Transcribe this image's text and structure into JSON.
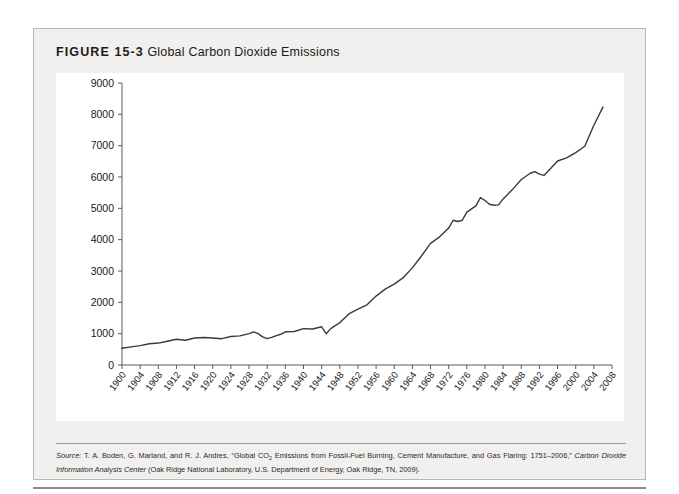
{
  "figure": {
    "label": "FIGURE 15-3",
    "name": "Global Carbon Dioxide Emissions"
  },
  "source": {
    "prefix": "Source:",
    "line": " T. A. Boden, G. Marland, and R. J. Andres, “Global CO2 Emissions from Fossil-Fuel Burning, Cement Manufacture, and Gas Flaring: 1751–2006,” ",
    "italic_work": "Carbon Dioxide Information Analysis Center",
    "tail": " (Oak Ridge National Laboratory, U.S. Department of Energy, Oak Ridge, TN, 2009)."
  },
  "colors": {
    "card_background": "#f1f0ee",
    "plot_background": "#ffffff",
    "line": "#3a3a3a",
    "axis": "#5a5a5a",
    "border": "#b9b7b4",
    "text": "#1a1a1a"
  },
  "chart_data": {
    "type": "line",
    "title": "Global Carbon Dioxide Emissions",
    "xlabel": "",
    "ylabel": "",
    "xlim": [
      1900,
      2008
    ],
    "ylim": [
      0,
      9000
    ],
    "ytick_values": [
      0,
      1000,
      2000,
      3000,
      4000,
      5000,
      6000,
      7000,
      8000,
      9000
    ],
    "ytick_labels": [
      "0",
      "1000",
      "2000",
      "3000",
      "4000",
      "5000",
      "6000",
      "7000",
      "8000",
      "9000"
    ],
    "xtick_values": [
      1900,
      1904,
      1908,
      1912,
      1916,
      1920,
      1924,
      1928,
      1932,
      1936,
      1940,
      1944,
      1948,
      1952,
      1956,
      1960,
      1964,
      1968,
      1972,
      1976,
      1980,
      1984,
      1988,
      1992,
      1996,
      2000,
      2004,
      2008
    ],
    "xtick_labels": [
      "1900",
      "1904",
      "1908",
      "1912",
      "1916",
      "1920",
      "1924",
      "1928",
      "1932",
      "1936",
      "1940",
      "1944",
      "1948",
      "1952",
      "1956",
      "1960",
      "1964",
      "1968",
      "1972",
      "1976",
      "1980",
      "1984",
      "1988",
      "1992",
      "1996",
      "2000",
      "2004",
      "2008"
    ],
    "grid": false,
    "legend": null,
    "series": [
      {
        "name": "Global CO2 emissions (million metric tons of carbon)",
        "x": [
          1900,
          1902,
          1904,
          1906,
          1908,
          1910,
          1912,
          1914,
          1916,
          1918,
          1920,
          1922,
          1924,
          1926,
          1928,
          1929,
          1930,
          1931,
          1932,
          1933,
          1934,
          1935,
          1936,
          1938,
          1940,
          1942,
          1944,
          1945,
          1946,
          1948,
          1950,
          1952,
          1954,
          1956,
          1958,
          1960,
          1962,
          1964,
          1966,
          1968,
          1970,
          1972,
          1973,
          1974,
          1975,
          1976,
          1978,
          1979,
          1980,
          1981,
          1982,
          1983,
          1984,
          1986,
          1988,
          1990,
          1991,
          1992,
          1993,
          1994,
          1996,
          1998,
          2000,
          2002,
          2004,
          2006
        ],
        "y": [
          534,
          580,
          620,
          680,
          700,
          760,
          820,
          790,
          860,
          880,
          860,
          840,
          910,
          930,
          1000,
          1060,
          1000,
          900,
          840,
          880,
          940,
          980,
          1060,
          1070,
          1160,
          1150,
          1220,
          1000,
          1160,
          1350,
          1630,
          1780,
          1920,
          2200,
          2420,
          2580,
          2790,
          3100,
          3480,
          3880,
          4090,
          4370,
          4620,
          4580,
          4620,
          4880,
          5080,
          5340,
          5250,
          5130,
          5100,
          5110,
          5300,
          5590,
          5920,
          6120,
          6170,
          6090,
          6050,
          6200,
          6510,
          6610,
          6780,
          6980,
          7650,
          8230
        ]
      }
    ],
    "endpoint_value": 8230,
    "start_value": 534,
    "peak_1929": 1060,
    "trough_1932": 840,
    "peak_1979": 5340,
    "trough_1983": 5110
  }
}
